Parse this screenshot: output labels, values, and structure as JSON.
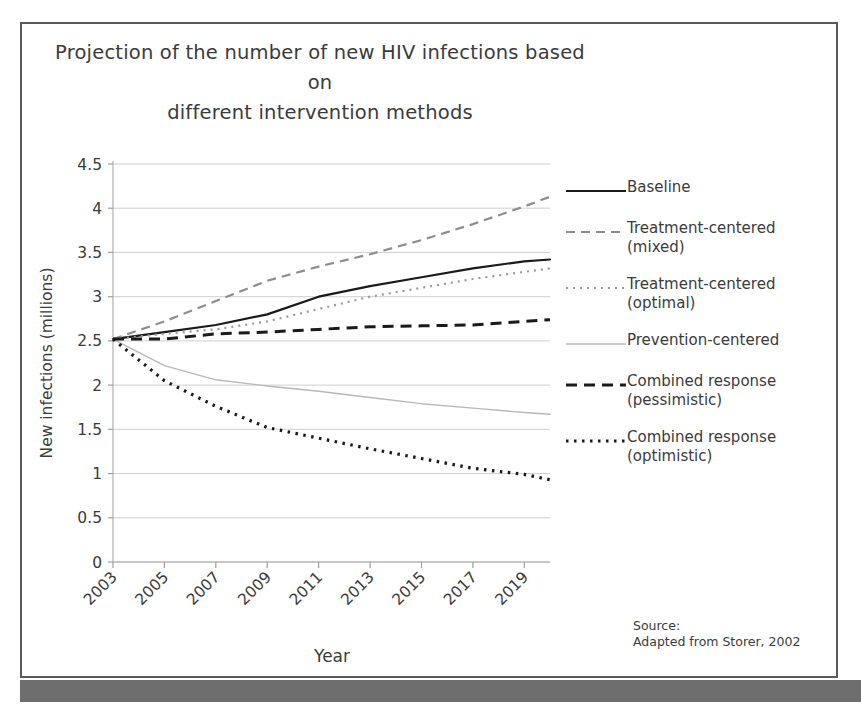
{
  "figure": {
    "title_line1": "Projection of the number of new HIV infections based on",
    "title_line2": "different intervention methods",
    "source_line1": "Source:",
    "source_line2": "Adapted from Storer, 2002",
    "frame_color": "#5a5a5a",
    "bottom_bar_color": "#6e6e6e",
    "background": "#ffffff"
  },
  "legend": {
    "items": [
      {
        "label": "Baseline",
        "style": "solid",
        "color": "#1a1a1a",
        "width": 2.2,
        "dash": "none"
      },
      {
        "label": "Treatment-centered\n(mixed)",
        "style": "dashed",
        "color": "#8d8d8d",
        "width": 2.2,
        "dash": "9,6"
      },
      {
        "label": "Treatment-centered\n(optimal)",
        "style": "dotted",
        "color": "#9a9a9a",
        "width": 2.2,
        "dash": "2,5"
      },
      {
        "label": "Prevention-centered",
        "style": "solid-light",
        "color": "#b8b8b8",
        "width": 1.4,
        "dash": "none"
      },
      {
        "label": "Combined response\n(pessimistic)",
        "style": "dashed-bold",
        "color": "#1a1a1a",
        "width": 3.0,
        "dash": "11,7"
      },
      {
        "label": "Combined response\n(optimistic)",
        "style": "dotted-bold",
        "color": "#1a1a1a",
        "width": 3.2,
        "dash": "2.5,5.5"
      }
    ]
  },
  "chart_data": {
    "type": "line",
    "title": "Projection of the number of new HIV infections based on different intervention methods",
    "xlabel": "Year",
    "ylabel": "New infections (millions)",
    "xlim": [
      2003,
      2020
    ],
    "ylim": [
      0,
      4.5
    ],
    "yticks": [
      "0",
      "0.5",
      "1",
      "1.5",
      "2",
      "2.5",
      "3",
      "3.5",
      "4",
      "4.5"
    ],
    "ytick_values": [
      0,
      0.5,
      1,
      1.5,
      2,
      2.5,
      3,
      3.5,
      4,
      4.5
    ],
    "xticks": [
      "2003",
      "2005",
      "2007",
      "2009",
      "2011",
      "2013",
      "2015",
      "2017",
      "2019"
    ],
    "xtick_values": [
      2003,
      2005,
      2007,
      2009,
      2011,
      2013,
      2015,
      2017,
      2019
    ],
    "xtick_rotation": 45,
    "grid": "horizontal",
    "legend_position": "right",
    "x": [
      2003,
      2005,
      2007,
      2009,
      2011,
      2013,
      2015,
      2017,
      2019,
      2020
    ],
    "series": [
      {
        "name": "Baseline",
        "color": "#1a1a1a",
        "dash": "none",
        "width": 2.2,
        "values": [
          2.52,
          2.6,
          2.68,
          2.8,
          3.0,
          3.12,
          3.22,
          3.32,
          3.4,
          3.42
        ]
      },
      {
        "name": "Treatment-centered (mixed)",
        "color": "#8d8d8d",
        "dash": "9,6",
        "width": 2.2,
        "values": [
          2.52,
          2.72,
          2.95,
          3.18,
          3.34,
          3.48,
          3.64,
          3.82,
          4.02,
          4.13
        ]
      },
      {
        "name": "Treatment-centered (optimal)",
        "color": "#9a9a9a",
        "dash": "2,5",
        "width": 2.2,
        "values": [
          2.52,
          2.58,
          2.63,
          2.72,
          2.86,
          3.0,
          3.1,
          3.2,
          3.28,
          3.32
        ]
      },
      {
        "name": "Prevention-centered",
        "color": "#b8b8b8",
        "dash": "none",
        "width": 1.4,
        "values": [
          2.52,
          2.22,
          2.06,
          1.99,
          1.93,
          1.86,
          1.79,
          1.74,
          1.69,
          1.67
        ]
      },
      {
        "name": "Combined response (pessimistic)",
        "color": "#1a1a1a",
        "dash": "11,7",
        "width": 3.0,
        "values": [
          2.52,
          2.52,
          2.58,
          2.6,
          2.63,
          2.66,
          2.67,
          2.68,
          2.72,
          2.74
        ]
      },
      {
        "name": "Combined response (optimistic)",
        "color": "#1a1a1a",
        "dash": "2.5,5.5",
        "width": 3.2,
        "values": [
          2.52,
          2.05,
          1.76,
          1.52,
          1.4,
          1.28,
          1.17,
          1.06,
          0.99,
          0.93
        ]
      }
    ]
  }
}
